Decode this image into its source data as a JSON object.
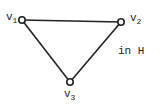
{
  "diagram": {
    "type": "graph",
    "vertices": [
      {
        "id": "v1",
        "name": "v",
        "sub": "1",
        "x": 22,
        "y": 20
      },
      {
        "id": "v2",
        "name": "v",
        "sub": "2",
        "x": 121,
        "y": 22
      },
      {
        "id": "v3",
        "name": "v",
        "sub": "3",
        "x": 70,
        "y": 82
      }
    ],
    "edges": [
      {
        "from": "v1",
        "to": "v2"
      },
      {
        "from": "v2",
        "to": "v3"
      },
      {
        "from": "v3",
        "to": "v1"
      }
    ],
    "caption": "in H",
    "colors": {
      "stroke": "#222222",
      "fill": "#ffffff"
    }
  }
}
